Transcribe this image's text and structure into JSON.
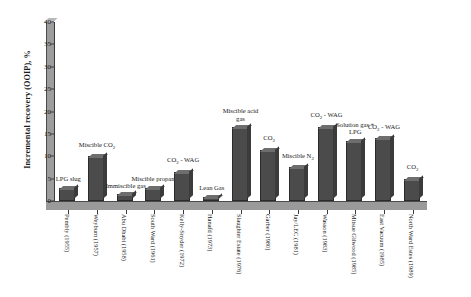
{
  "chart_data": {
    "type": "bar",
    "title": "",
    "xlabel": "",
    "ylabel": "Incremental recovery (OOIP), %",
    "ylim": [
      0,
      40
    ],
    "ytick_values": [
      0,
      5,
      10,
      15,
      20,
      25,
      30,
      35,
      40
    ],
    "grid": false,
    "legend": "none",
    "bar_color": "#4b4b4b",
    "categories": [
      "Pembly (1955)",
      "Weyburn (1957)",
      "Abu Dhabi (1958)",
      "South Ward (1961)",
      "Kelly-Snyder (1972)",
      "Hanafd (1973)",
      "Slaughter Estate (1976)",
      "Garber (1980)",
      "Jay/LEC (1981)",
      "Wasson (1983)",
      "Mitsue Gilwood (1985)",
      "East Vacuum (1985)",
      "North Ward Estes (1989)"
    ],
    "values": [
      3,
      10,
      1.5,
      3,
      6.5,
      1,
      16.5,
      11.5,
      7.5,
      16.5,
      13.5,
      14,
      5
    ],
    "point_labels": [
      "LPG slug",
      "Miscible CO₂",
      "Immiscible gas",
      "Miscible propane",
      "CO₂ - WAG",
      "Lean Gas",
      "Miscible acid gas",
      "CO₂",
      "Miscible N₂",
      "CO₂ - WAG",
      "Solution gas + LPG",
      "CO₂ - WAG",
      "CO₂"
    ]
  },
  "axis": {
    "y_title": "Incremental recovery (OOIP), %"
  }
}
